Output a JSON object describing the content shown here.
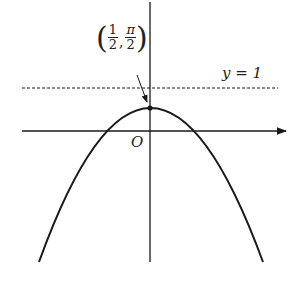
{
  "diagram": {
    "origin_label": "O",
    "asymptote_label": "y = 1",
    "vertex_label": {
      "x_num": "1",
      "x_den": "2",
      "y_num": "π",
      "y_den": "2"
    },
    "colors": {
      "stroke": "#1a1a1a",
      "background": "#ffffff"
    }
  }
}
